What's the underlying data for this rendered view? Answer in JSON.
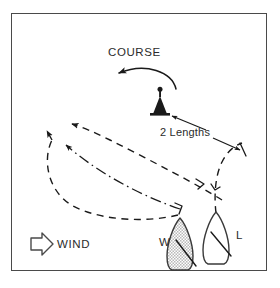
{
  "figure": {
    "kind": "sailing-mark-rounding-diagram",
    "border_color": "#4a4a4a",
    "background": "#ffffff",
    "ink_color": "#1a1a1a",
    "labels": {
      "course": "COURSE",
      "two_lengths": "2 Lengths",
      "wind": "WIND",
      "windward_boat": "W",
      "leeward_boat": "L"
    },
    "icons": {
      "course_arrow": "curved-arrow-icon",
      "mark": "racing-mark-buoy-icon",
      "dimension_arrow": "double-headed-dimension-arrow-icon",
      "wind_arrow": "outlined-right-arrow-icon",
      "track_windward": "dashed-track-icon",
      "track_leeward": "dashed-track-icon",
      "zone_boundary": "dash-dot-track-icon",
      "boat_windward": "sailboat-hull-shaded-icon",
      "boat_leeward": "sailboat-hull-outline-icon"
    },
    "line_styles": {
      "outer_dashed": "dashed",
      "inner_dashed": "dashed",
      "middle_chain": "dash-dot",
      "course_arc": "solid"
    },
    "boats": [
      {
        "id": "W",
        "label": "W",
        "fill": "shaded",
        "role": "windward"
      },
      {
        "id": "L",
        "label": "L",
        "fill": "white",
        "role": "leeward"
      }
    ]
  }
}
